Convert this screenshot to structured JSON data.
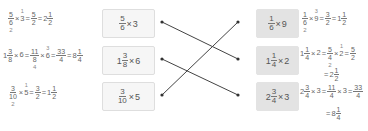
{
  "left": [
    {
      "expr": {
        "num": "5",
        "den": "6",
        "op": "×",
        "mult": "3"
      },
      "work": {
        "f1": {
          "num": "5",
          "den": "6",
          "den_cancel": "2"
        },
        "op1": "×",
        "m": "3",
        "m_cancel": "1",
        "eq1": "=",
        "r": {
          "num": "5",
          "den": "2"
        },
        "eq2": "=",
        "mixed": {
          "whole": "2",
          "num": "1",
          "den": "2"
        }
      }
    },
    {
      "expr": {
        "whole": "1",
        "num": "3",
        "den": "8",
        "op": "×",
        "mult": "6"
      },
      "work": {
        "w0": "1",
        "f0": {
          "num": "3",
          "den": "8"
        },
        "op0": "×",
        "m0": "6",
        "eq0": "=",
        "f1": {
          "num": "11",
          "den": "8",
          "den_cancel": "4"
        },
        "op1": "×",
        "m": "6",
        "m_cancel": "3",
        "eq1": "=",
        "r": {
          "num": "33",
          "den": "4"
        },
        "eq2": "=",
        "mixed": {
          "whole": "8",
          "num": "1",
          "den": "4"
        }
      }
    },
    {
      "expr": {
        "num": "3",
        "den": "10",
        "op": "×",
        "mult": "5"
      },
      "work": {
        "f1": {
          "num": "3",
          "den": "10",
          "den_cancel": "2"
        },
        "op1": "×",
        "m": "5",
        "m_cancel": "1",
        "eq1": "=",
        "r": {
          "num": "3",
          "den": "2"
        },
        "eq2": "=",
        "mixed": {
          "whole": "1",
          "num": "1",
          "den": "2"
        }
      }
    }
  ],
  "right": [
    {
      "expr": {
        "num": "1",
        "den": "6",
        "op": "×",
        "mult": "9"
      },
      "work": {
        "f1": {
          "num": "1",
          "den": "6",
          "den_cancel": "2"
        },
        "op1": "×",
        "m": "9",
        "m_cancel": "3",
        "eq1": "=",
        "r": {
          "num": "3",
          "den": "2"
        },
        "eq2": "=",
        "mixed": {
          "whole": "1",
          "num": "1",
          "den": "2"
        }
      }
    },
    {
      "expr": {
        "whole": "1",
        "num": "1",
        "den": "4",
        "op": "×",
        "mult": "2"
      },
      "work": {
        "w0": "1",
        "f0": {
          "num": "1",
          "den": "4"
        },
        "op0": "×",
        "m0": "2",
        "eq0": "=",
        "f1": {
          "num": "5",
          "den": "4",
          "den_cancel": "2"
        },
        "op1": "×",
        "m": "2",
        "m_cancel": "1",
        "eq1": "=",
        "r": {
          "num": "5",
          "den": "2"
        },
        "eq2": "=",
        "mixed": {
          "whole": "2",
          "num": "1",
          "den": "2"
        }
      }
    },
    {
      "expr": {
        "whole": "2",
        "num": "3",
        "den": "4",
        "op": "×",
        "mult": "3"
      },
      "work": {
        "w0": "2",
        "f0": {
          "num": "3",
          "den": "4"
        },
        "op0": "×",
        "m0": "3",
        "eq0": "=",
        "f1": {
          "num": "11",
          "den": "4"
        },
        "op1": "×",
        "m": "3",
        "eq1": "=",
        "r": {
          "num": "33",
          "den": "4"
        },
        "eq2": "=",
        "mixed": {
          "whole": "8",
          "num": "1",
          "den": "4"
        }
      }
    }
  ],
  "connections": [
    {
      "from": "left-0",
      "to": "right-1"
    },
    {
      "from": "left-1",
      "to": "right-2"
    },
    {
      "from": "left-2",
      "to": "right-0"
    }
  ],
  "colors": {
    "line": "#444444",
    "box_left": "#f6f6f6",
    "box_right": "#e3e3e3"
  }
}
